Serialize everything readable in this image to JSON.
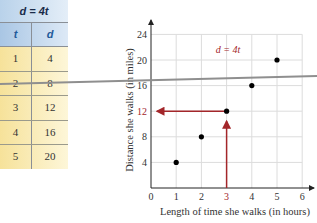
{
  "table": {
    "title": "d = 4t",
    "headers": [
      "t",
      "d"
    ],
    "rows": [
      [
        "1",
        "4"
      ],
      [
        "2",
        "8"
      ],
      [
        "3",
        "12"
      ],
      [
        "4",
        "16"
      ],
      [
        "5",
        "20"
      ]
    ]
  },
  "chart_data": {
    "type": "scatter",
    "title": "",
    "annotation": "d = 4t",
    "xlabel": "Length of time she walks (in hours)",
    "ylabel": "Distance she walks (in miles)",
    "x": [
      1,
      2,
      3,
      4,
      5
    ],
    "y": [
      4,
      8,
      12,
      16,
      20
    ],
    "xlim": [
      0,
      6
    ],
    "ylim": [
      0,
      24
    ],
    "xticks": [
      "0",
      "1",
      "2",
      "3",
      "4",
      "5",
      "6"
    ],
    "yticks": [
      "4",
      "8",
      "12",
      "16",
      "20",
      "24"
    ],
    "grid": true,
    "highlight": {
      "x": 3,
      "y": 12,
      "color": "#a3262a"
    }
  },
  "colors": {
    "accent": "#a3262a",
    "grid": "#dcdcdc",
    "points": "#000000",
    "overlay_line": "#8f8f8f"
  }
}
